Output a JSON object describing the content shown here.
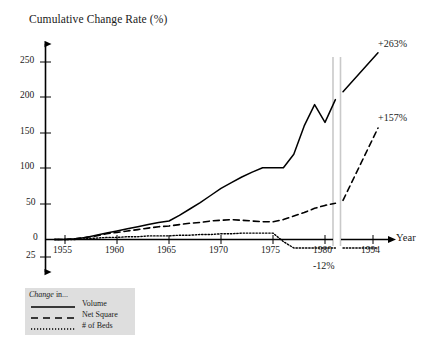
{
  "chart_data": {
    "type": "line",
    "title": "Cumulative Change Rate (%)",
    "ylabel": "Cumulative Change Rate (%)",
    "xlabel": "Year",
    "ylim": [
      -25,
      275
    ],
    "xlim": [
      1953,
      1994
    ],
    "grid": false,
    "legend_position": "bottom-left",
    "axis_break": {
      "after": 1981,
      "before": 1982,
      "label": "axis-break"
    },
    "ytick_labels": [
      "250",
      "200",
      "150",
      "100",
      "50",
      "0",
      "25"
    ],
    "ytick_values": [
      250,
      200,
      150,
      100,
      50,
      0,
      -25
    ],
    "xtick_labels": [
      "1955",
      "1960",
      "1965",
      "1970",
      "1975",
      "1980",
      "1994"
    ],
    "xtick_values": [
      1955,
      1960,
      1965,
      1970,
      1975,
      1980,
      1994
    ],
    "series": [
      {
        "name": "Volume",
        "style": "solid",
        "end_label": "+263%",
        "x": [
          1954,
          1955,
          1956,
          1957,
          1958,
          1959,
          1960,
          1961,
          1962,
          1963,
          1964,
          1965,
          1966,
          1967,
          1968,
          1969,
          1970,
          1971,
          1972,
          1973,
          1974,
          1975,
          1976,
          1977,
          1978,
          1979,
          1980,
          1981,
          1982,
          1994
        ],
        "y": [
          0,
          0,
          1,
          3,
          6,
          9,
          12,
          15,
          18,
          21,
          24,
          26,
          34,
          43,
          52,
          62,
          72,
          80,
          88,
          95,
          101,
          101,
          101,
          120,
          160,
          190,
          165,
          197,
          208,
          263
        ]
      },
      {
        "name": "Net Square",
        "style": "dashed",
        "end_label": "+157%",
        "x": [
          1954,
          1955,
          1956,
          1957,
          1958,
          1959,
          1960,
          1961,
          1962,
          1963,
          1964,
          1965,
          1966,
          1967,
          1968,
          1969,
          1970,
          1971,
          1972,
          1973,
          1974,
          1975,
          1976,
          1977,
          1978,
          1979,
          1980,
          1981,
          1982,
          1994
        ],
        "y": [
          0,
          0,
          1,
          3,
          5,
          8,
          10,
          12,
          14,
          16,
          18,
          19,
          21,
          23,
          24,
          26,
          27,
          28,
          27,
          26,
          25,
          25,
          28,
          33,
          38,
          44,
          48,
          51,
          55,
          157
        ]
      },
      {
        "name": "# of Beds",
        "style": "dotted",
        "end_label": "-12%",
        "x": [
          1954,
          1955,
          1956,
          1957,
          1958,
          1959,
          1960,
          1961,
          1962,
          1963,
          1964,
          1965,
          1966,
          1967,
          1968,
          1969,
          1970,
          1971,
          1972,
          1973,
          1974,
          1975,
          1976,
          1977,
          1978,
          1979,
          1980,
          1981,
          1982,
          1994
        ],
        "y": [
          0,
          0,
          0,
          1,
          2,
          3,
          3,
          4,
          4,
          5,
          5,
          5,
          6,
          6,
          7,
          7,
          8,
          8,
          9,
          9,
          9,
          9,
          -3,
          -12,
          -12,
          -12,
          -12,
          -12,
          -12,
          -12
        ]
      }
    ]
  },
  "axis": {
    "y_title": "Cumulative Change Rate (%)",
    "x_title": "Year"
  },
  "annotations": {
    "volume_end": "+263%",
    "netsquare_end": "+157%",
    "beds_end": "-12%"
  },
  "legend": {
    "heading_italic": "Change",
    "heading_rest": " in...",
    "items": [
      {
        "label": "Volume",
        "style": "solid"
      },
      {
        "label": "Net Square",
        "style": "dashed"
      },
      {
        "label": "# of Beds",
        "style": "dotted"
      }
    ]
  },
  "colors": {
    "line": "#000000",
    "axis": "#000000",
    "legend_background": "#dedede",
    "break_line": "#cccccc",
    "text": "#1a1a1a"
  }
}
